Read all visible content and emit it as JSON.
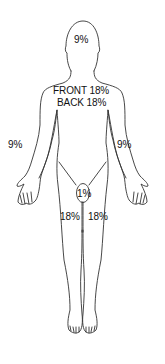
{
  "diagram": {
    "type": "rule-of-nines-body-chart",
    "stroke_color": "#333333",
    "label_color": "#111111",
    "regions": {
      "head": {
        "label": "9%"
      },
      "trunk_front": {
        "label": "FRONT 18%"
      },
      "trunk_back": {
        "label": "BACK 18%"
      },
      "right_arm": {
        "label": "9%"
      },
      "left_arm": {
        "label": "9%"
      },
      "genitals": {
        "label": "1%"
      },
      "right_leg": {
        "label": "18%"
      },
      "left_leg": {
        "label": "18%"
      }
    }
  }
}
